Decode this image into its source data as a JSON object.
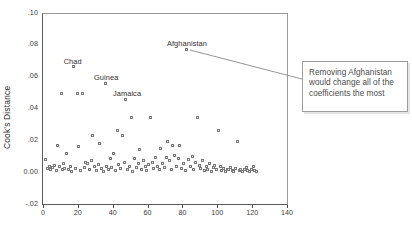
{
  "chart_data": {
    "type": "scatter",
    "title": "",
    "xlabel": "",
    "ylabel": "Cook's Distance",
    "xlim": [
      0,
      140
    ],
    "ylim": [
      -0.02,
      0.1
    ],
    "xticks": [
      "0",
      "20",
      "40",
      "60",
      "80",
      "100",
      "120",
      "140"
    ],
    "xtick_values": [
      0,
      20,
      40,
      60,
      80,
      100,
      120,
      140
    ],
    "yticks": [
      ".10",
      ".08",
      ".06",
      ".04",
      ".02",
      "0.00",
      "-.02"
    ],
    "ytick_values": [
      0.1,
      0.08,
      0.06,
      0.04,
      0.02,
      0.0,
      -0.02
    ],
    "grid": false,
    "legend": "none",
    "marker": "open-square",
    "marker_color": "#7a7a7a",
    "annotations": [
      {
        "label": "Chad",
        "x": 17,
        "y": 0.067,
        "label_dx": -10,
        "label_dy": -9
      },
      {
        "label": "Guinea",
        "x": 35,
        "y": 0.0565,
        "label_dx": -11,
        "label_dy": -9
      },
      {
        "label": "Jamaica",
        "x": 47,
        "y": 0.0465,
        "label_dx": -13,
        "label_dy": -9
      },
      {
        "label": "Afghanistan",
        "x": 82,
        "y": 0.078,
        "label_dx": -20,
        "label_dy": -9
      }
    ],
    "points": [
      [
        1,
        0.0085
      ],
      [
        2,
        0.003
      ],
      [
        3,
        0.0045
      ],
      [
        4,
        0.002
      ],
      [
        5,
        0.0035
      ],
      [
        6,
        0.005
      ],
      [
        7,
        0.0015
      ],
      [
        8,
        0.0175
      ],
      [
        9,
        0.004
      ],
      [
        10,
        0.05
      ],
      [
        10.5,
        0.0025
      ],
      [
        11,
        0.006
      ],
      [
        12,
        0.003
      ],
      [
        13,
        0.0125
      ],
      [
        14,
        0.002
      ],
      [
        15,
        0.0045
      ],
      [
        16,
        0.001
      ],
      [
        17,
        0.067
      ],
      [
        18,
        0.003
      ],
      [
        19,
        0.05
      ],
      [
        20,
        0.0165
      ],
      [
        21,
        0.0015
      ],
      [
        22,
        0.05
      ],
      [
        23,
        0.0035
      ],
      [
        24,
        0.007
      ],
      [
        25,
        0.006
      ],
      [
        26,
        0.0025
      ],
      [
        27,
        0.008
      ],
      [
        28,
        0.0235
      ],
      [
        29,
        0.004
      ],
      [
        30,
        0.0015
      ],
      [
        31,
        0.0055
      ],
      [
        32,
        0.0185
      ],
      [
        33,
        0.003
      ],
      [
        34,
        0.001
      ],
      [
        35,
        0.0565
      ],
      [
        36,
        0.0045
      ],
      [
        37,
        0.002
      ],
      [
        38,
        0.009
      ],
      [
        39,
        0.0035
      ],
      [
        40,
        0.0125
      ],
      [
        41,
        0.0015
      ],
      [
        42,
        0.027
      ],
      [
        43,
        0.0055
      ],
      [
        44,
        0.003
      ],
      [
        45,
        0.0235
      ],
      [
        46,
        0.0065
      ],
      [
        47,
        0.0465
      ],
      [
        48,
        0.002
      ],
      [
        49,
        0.0045
      ],
      [
        50,
        0.035
      ],
      [
        51,
        0.001
      ],
      [
        52,
        0.0095
      ],
      [
        53,
        0.0035
      ],
      [
        54,
        0.006
      ],
      [
        55,
        0.015
      ],
      [
        56,
        0.0025
      ],
      [
        57,
        0.008
      ],
      [
        58,
        0.004
      ],
      [
        59,
        0.0015
      ],
      [
        60,
        0.0055
      ],
      [
        61,
        0.035
      ],
      [
        62,
        0.007
      ],
      [
        63,
        0.003
      ],
      [
        64,
        0.01
      ],
      [
        65,
        0.0045
      ],
      [
        66,
        0.002
      ],
      [
        67,
        0.0155
      ],
      [
        68,
        0.006
      ],
      [
        69,
        0.0035
      ],
      [
        70,
        0.01
      ],
      [
        71,
        0.02
      ],
      [
        72,
        0.008
      ],
      [
        73,
        0.0025
      ],
      [
        74,
        0.0175
      ],
      [
        75,
        0.011
      ],
      [
        76,
        0.0045
      ],
      [
        77,
        0.0095
      ],
      [
        78,
        0.0175
      ],
      [
        79,
        0.003
      ],
      [
        80,
        0.006
      ],
      [
        81,
        0.0015
      ],
      [
        82,
        0.078
      ],
      [
        83,
        0.0085
      ],
      [
        84,
        0.004
      ],
      [
        85,
        0.0105
      ],
      [
        86,
        0.002
      ],
      [
        87,
        0.007
      ],
      [
        88,
        0.035
      ],
      [
        89,
        0.005
      ],
      [
        90,
        0.003
      ],
      [
        91,
        0.008
      ],
      [
        92,
        0.0015
      ],
      [
        93,
        0.0045
      ],
      [
        94,
        0.0025
      ],
      [
        95,
        0.006
      ],
      [
        96,
        0.001
      ],
      [
        97,
        0.0035
      ],
      [
        98,
        0.005
      ],
      [
        99,
        0.002
      ],
      [
        100,
        0.027
      ],
      [
        101,
        0.004
      ],
      [
        102,
        0.0015
      ],
      [
        103,
        0.003
      ],
      [
        104,
        0.001
      ],
      [
        105,
        0.0025
      ],
      [
        106,
        0.002
      ],
      [
        107,
        0.0035
      ],
      [
        108,
        0.0015
      ],
      [
        109,
        0.001
      ],
      [
        110,
        0.003
      ],
      [
        111,
        0.02
      ],
      [
        112,
        0.0015
      ],
      [
        113,
        0.0025
      ],
      [
        114,
        0.001
      ],
      [
        115,
        0.002
      ],
      [
        116,
        0.0035
      ],
      [
        117,
        0.0015
      ],
      [
        118,
        0.001
      ],
      [
        119,
        0.0025
      ],
      [
        120,
        0.004
      ],
      [
        121,
        0.0015
      ],
      [
        122,
        0.001
      ]
    ]
  },
  "callout": {
    "text": "Removing Afghanistan would change all of the coefficients the most"
  }
}
